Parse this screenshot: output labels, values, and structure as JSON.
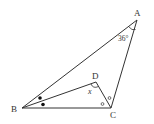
{
  "diagram": {
    "type": "geometry-triangle",
    "vertices": {
      "A": {
        "label": "A",
        "x": 137,
        "y": 20
      },
      "B": {
        "label": "B",
        "x": 22,
        "y": 108
      },
      "C": {
        "label": "C",
        "x": 111,
        "y": 108
      },
      "D": {
        "label": "D",
        "x": 96,
        "y": 82
      }
    },
    "segments": [
      "AB",
      "BC",
      "CA",
      "BD",
      "DC"
    ],
    "angle_labels": {
      "A": "36°",
      "D": "x"
    },
    "markings": {
      "B_bisector": "equal angles marked with filled dots",
      "C_bisector": "equal angles marked with open circles"
    },
    "colors": {
      "stroke": "#333333",
      "background": "#ffffff"
    }
  }
}
